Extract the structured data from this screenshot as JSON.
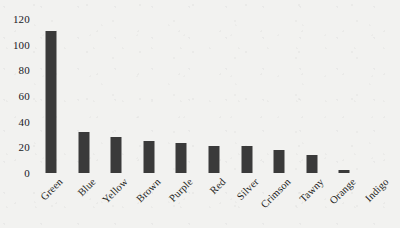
{
  "chart_data": {
    "type": "bar",
    "title": "",
    "subtitle": "",
    "xlabel": "",
    "ylabel": "",
    "ylim": [
      0,
      120
    ],
    "yticks": [
      0,
      20,
      40,
      60,
      80,
      100,
      120
    ],
    "ytick_labels": [
      "0",
      "20",
      "40",
      "60",
      "80",
      "100",
      "120"
    ],
    "grid": false,
    "legend": false,
    "legend_position": "none",
    "bar_color": "#3a3a3a",
    "background_color": "#f2f2f0",
    "text_color": "#1d1d1b",
    "xtick_rotation": -45,
    "categories": [
      "Green",
      "Blue",
      "Yellow",
      "Brown",
      "Purple",
      "Red",
      "Silver",
      "Crimson",
      "Tawny",
      "Orange",
      "Indigo"
    ],
    "values": [
      111,
      32,
      28,
      25,
      23,
      21,
      21,
      18,
      14,
      2,
      0
    ]
  }
}
